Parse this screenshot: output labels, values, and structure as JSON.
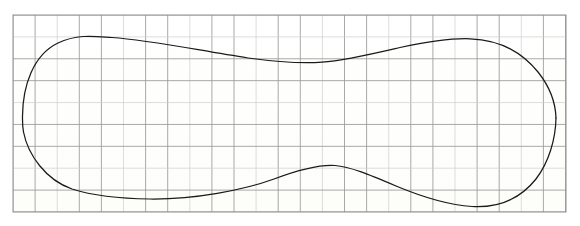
{
  "figure": {
    "kind": "scanned-graph-paper-drawing",
    "background_color": "#ffffff",
    "paper_color": "#fdfdfb",
    "grid": {
      "line_color": "#9a9a9a",
      "line_color_faint": "#cfcfcf",
      "cell_size_px": 22.1,
      "columns": 25,
      "rows": 9,
      "left_px": 13,
      "top_px": 15,
      "right_px": 566,
      "bottom_px": 212,
      "border_color": "#8f8f8f"
    },
    "curve": {
      "stroke_color": "#1a1a1a",
      "stroke_width_px": 1.25,
      "closed": true,
      "shape_name": "dumbbell-peanut-outline",
      "extremes": {
        "leftmost_x": 22,
        "leftmost_y": 116,
        "rightmost_x": 556,
        "rightmost_y": 118,
        "top_left_peak_x": 110,
        "top_left_peak_y": 37,
        "top_right_peak_x": 470,
        "top_right_peak_y": 39,
        "top_waist_x": 322,
        "top_waist_y": 62,
        "bottom_left_trough_x": 115,
        "bottom_left_trough_y": 197,
        "bottom_right_trough_x": 470,
        "bottom_right_trough_y": 194,
        "bottom_waist_x": 335,
        "bottom_waist_y": 165
      },
      "top_edge_path": "M 22.5 116 C 22.8 86 33 55 58 43 C 78 33.5 96 36.5 112 37.5 C 150 40 196 50 248 58 C 285 63 305 63.5 322 62.2 C 345 60.5 372 54 400 47.5 C 428 41.5 452 38.2 470 38.8 C 500 39.8 522 52 538 72 C 550 87 555.5 102 556 118",
      "bottom_edge_path": "M 556 118 C 555.6 139 549 162 536 179 C 520 199 498 208 472 206.5 C 448 205 420 196 396 186 C 370 175 350 166.5 335 165.5 C 318 164.4 298 170 274 179 C 244 190 194 199.5 150 199 C 118 198.6 94 196 72 189 C 46 180 28 155 23.5 132 C 22.6 127 22.4 121.5 22.5 116"
    }
  },
  "accessibility": {
    "alt_text": "A closed, symmetric dumbbell-shaped (peanut-shaped) curve drawn by hand over a square grid of graph paper, narrow in the middle and bulging at both ends."
  }
}
